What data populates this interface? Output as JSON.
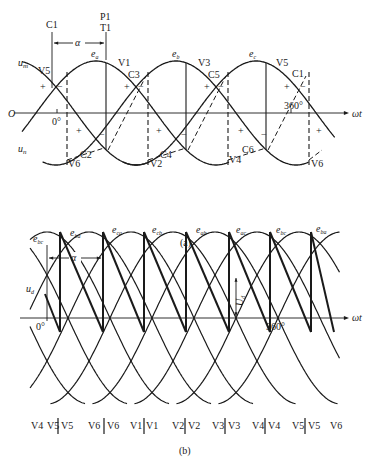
{
  "figure_a": {
    "caption": "(a)",
    "axis_origin_label": "O",
    "axis_x_label": "ωt",
    "upper_envelope_label": "u",
    "upper_envelope_sub": "m",
    "lower_envelope_label": "u",
    "lower_envelope_sub": "n",
    "tick_0_label": "0°",
    "tick_360_label": "360°",
    "alpha_label": "α",
    "commutation_marker_label": "C1",
    "pulse_marker_label_top": "P1",
    "pulse_marker_label_bottom": "T1",
    "phase_labels": [
      {
        "base": "e",
        "sub": "a"
      },
      {
        "base": "e",
        "sub": "b"
      },
      {
        "base": "e",
        "sub": "c"
      }
    ],
    "upper_thyristor_labels": [
      "V5",
      "V1",
      "V3",
      "V5"
    ],
    "upper_commutation_labels": [
      "C3",
      "C5",
      "C1"
    ],
    "lower_thyristor_labels": [
      "V6",
      "V2",
      "V4",
      "V6"
    ],
    "lower_commutation_labels": [
      "C2",
      "C4",
      "C6"
    ],
    "polarity_plus": "+",
    "polarity_minus": "−"
  },
  "figure_b": {
    "caption": "(b)",
    "axis_x_label": "ωt",
    "output_label": "u",
    "output_sub": "d",
    "ud_arrow_label": "U",
    "ud_arrow_sub": "d",
    "tick_0_label": "0°",
    "tick_360_label": "360°",
    "alpha_label": "α",
    "line_voltage_labels": [
      {
        "base": "e",
        "sub": "bc"
      },
      {
        "base": "e",
        "sub": "ba"
      },
      {
        "base": "e",
        "sub": "ca"
      },
      {
        "base": "e",
        "sub": "cb"
      },
      {
        "base": "e",
        "sub": "ab"
      },
      {
        "base": "e",
        "sub": "ac"
      },
      {
        "base": "e",
        "sub": "bc"
      },
      {
        "base": "e",
        "sub": "ba"
      }
    ],
    "conduction_sequence": [
      {
        "left": "V4",
        "right": "V5",
        "sep": false
      },
      {
        "left": "V5",
        "right": "V6",
        "sep": true
      },
      {
        "left": "V6",
        "right": "V1",
        "sep": true
      },
      {
        "left": "V1",
        "right": "V2",
        "sep": true
      },
      {
        "left": "V2",
        "right": "V3",
        "sep": true
      },
      {
        "left": "V3",
        "right": "V4",
        "sep": true
      },
      {
        "left": "V4",
        "right": "V5",
        "sep": true
      },
      {
        "left": "V5",
        "right": "V6",
        "sep": true
      }
    ]
  },
  "colors": {
    "stroke": "#1a1a1a",
    "background": "#ffffff"
  }
}
